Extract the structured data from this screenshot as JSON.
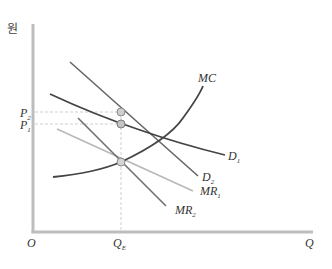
{
  "diagram": {
    "y_axis_label": "원",
    "x_axis_label": "Q",
    "origin_label": "O",
    "price_labels": {
      "p2": "P",
      "p2_sub": "2",
      "p1": "P",
      "p1_sub": "1"
    },
    "quantity_label": {
      "text": "Q",
      "sub": "E"
    },
    "curves": {
      "mc": "MC",
      "d1": {
        "text": "D",
        "sub": "1"
      },
      "d2": {
        "text": "D",
        "sub": "2"
      },
      "mr1": {
        "text": "MR",
        "sub": "1"
      },
      "mr2": {
        "text": "MR",
        "sub": "2"
      }
    },
    "colors": {
      "axis": "#bdbdbd",
      "curve_dark": "#4a4a4a",
      "curve_mid": "#7a7a7a",
      "curve_light": "#b8b8b8",
      "dot_fill": "#c9c9c9",
      "dot_stroke": "#8a8a8a",
      "guide": "#cfcfcf"
    }
  }
}
